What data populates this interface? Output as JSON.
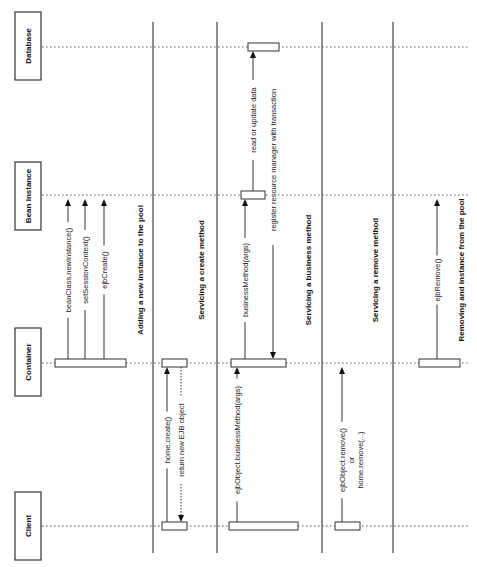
{
  "diagram": {
    "type": "sequence",
    "orientation": "rotated-90-ccw",
    "actors": [
      {
        "id": "database",
        "label": "Database",
        "lane_y": 47,
        "box": {
          "x": 15,
          "y": 12,
          "w": 26,
          "h": 68
        }
      },
      {
        "id": "bean",
        "label": "Bean Instance",
        "lane_y": 195,
        "box": {
          "x": 15,
          "y": 162,
          "w": 26,
          "h": 68
        }
      },
      {
        "id": "container",
        "label": "Container",
        "lane_y": 363,
        "box": {
          "x": 15,
          "y": 328,
          "w": 26,
          "h": 68
        }
      },
      {
        "id": "client",
        "label": "Client",
        "lane_y": 526,
        "box": {
          "x": 15,
          "y": 492,
          "w": 26,
          "h": 68
        }
      }
    ],
    "separators": [
      153,
      217,
      322,
      393
    ],
    "sections": [
      {
        "title": "Adding a new instance to the pool",
        "title_x": 143,
        "title_y": 270,
        "activations": [
          {
            "actor": "container",
            "x1": 55,
            "x2": 126
          }
        ],
        "messages": [
          {
            "label": "beanClass.newInstance()",
            "x": 68,
            "from": "container",
            "to": "bean",
            "style": "solid",
            "label_y": 270
          },
          {
            "label": "setSessionContext()",
            "x": 85,
            "from": "container",
            "to": "bean",
            "style": "solid",
            "label_y": 270
          },
          {
            "label": "ejbCreate()",
            "x": 104,
            "from": "container",
            "to": "bean",
            "style": "solid",
            "label_y": 270
          }
        ]
      },
      {
        "title": "Servicing a create method",
        "title_x": 204,
        "title_y": 270,
        "activations": [
          {
            "actor": "container",
            "x1": 162,
            "x2": 187
          },
          {
            "actor": "client",
            "x1": 162,
            "x2": 187
          }
        ],
        "messages": [
          {
            "label": "home.create()",
            "x": 167,
            "from": "client",
            "to": "container",
            "style": "solid",
            "label_y": 440
          },
          {
            "label": "return new EJB object",
            "x": 181,
            "from": "container",
            "to": "client",
            "style": "dotted",
            "label_y": 440
          }
        ]
      },
      {
        "title": "Servicing a business method",
        "title_x": 311,
        "title_y": 270,
        "activations": [
          {
            "actor": "database",
            "x1": 248,
            "x2": 279
          },
          {
            "actor": "bean",
            "x1": 241,
            "x2": 265
          },
          {
            "actor": "container",
            "x1": 231,
            "x2": 286
          },
          {
            "actor": "client",
            "x1": 229,
            "x2": 298
          }
        ],
        "messages": [
          {
            "label": "ejbObject.businessMethod(args)",
            "x": 237,
            "from": "client",
            "to": "container",
            "style": "solid",
            "label_y": 440
          },
          {
            "label": "businessMethod(args)",
            "x": 245,
            "from": "container",
            "to": "bean",
            "style": "solid",
            "label_y": 280
          },
          {
            "label": "register resource manager with transaction",
            "x": 273,
            "from": "bean",
            "to": "container",
            "style": "solid",
            "label_y": 160
          },
          {
            "label": "read or update data",
            "x": 253,
            "from": "bean",
            "to": "database",
            "style": "solid",
            "label_y": 120
          }
        ]
      },
      {
        "title": "Servicing a remove method",
        "title_x": 378,
        "title_y": 270,
        "activations": [
          {
            "actor": "client",
            "x1": 335,
            "x2": 360
          }
        ],
        "messages": [
          {
            "label": "ejbObject.remove()",
            "label2": "or",
            "label3": "home.remove(...)",
            "x": 342,
            "from": "client",
            "to": "container",
            "style": "solid",
            "label_y": 460
          }
        ]
      },
      {
        "title": "Removing and instance from the pool",
        "title_x": 464,
        "title_y": 270,
        "activations": [
          {
            "actor": "container",
            "x1": 419,
            "x2": 460
          }
        ],
        "messages": [
          {
            "label": "ejbRemove()",
            "x": 437,
            "from": "container",
            "to": "bean",
            "style": "solid",
            "label_y": 280
          }
        ]
      }
    ]
  }
}
